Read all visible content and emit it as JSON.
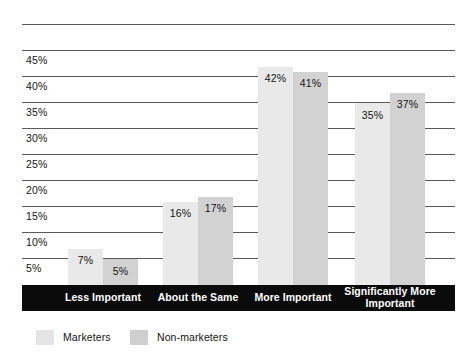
{
  "chart_data": {
    "type": "bar",
    "title": "",
    "subtitle": "",
    "xlabel": "",
    "ylabel": "",
    "categories": [
      "Less Important",
      "About the Same",
      "More Important",
      "Significantly More Important"
    ],
    "series": [
      {
        "name": "Marketers",
        "values": [
          7,
          16,
          42,
          35
        ],
        "color": "#e9e9e9"
      },
      {
        "name": "Non-marketers",
        "values": [
          5,
          17,
          41,
          37
        ],
        "color": "#d2d2d2"
      }
    ],
    "value_labels": [
      [
        "7%",
        "5%"
      ],
      [
        "16%",
        "17%"
      ],
      [
        "42%",
        "41%"
      ],
      [
        "35%",
        "37%"
      ]
    ],
    "ylim": [
      0,
      50
    ],
    "ytick_values": [
      45,
      40,
      35,
      30,
      25,
      20,
      15,
      10,
      5
    ],
    "ytick_labels": [
      "45%",
      "40%",
      "35%",
      "30%",
      "25%",
      "20%",
      "15%",
      "10%",
      "5%"
    ],
    "gridline_values": [
      50,
      45,
      40,
      35,
      30,
      25,
      20,
      15,
      10,
      5
    ],
    "grid": true,
    "legend_position": "bottom-left",
    "legend_entries": [
      "Marketers",
      "Non-marketers"
    ],
    "value_label_unit": "%"
  }
}
